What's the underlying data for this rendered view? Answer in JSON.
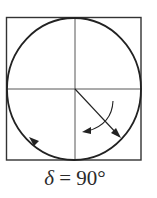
{
  "figure": {
    "caption": {
      "symbol": "δ",
      "equals": " = ",
      "value": "90°"
    },
    "elements": [
      {
        "name": "bounding-square",
        "type": "rect"
      },
      {
        "name": "trajectory-circle",
        "type": "ellipse"
      },
      {
        "name": "vertical-axis",
        "type": "line"
      },
      {
        "name": "horizontal-axis",
        "type": "line"
      },
      {
        "name": "field-vector",
        "type": "arrow",
        "direction": "down-right"
      },
      {
        "name": "rotation-arrow",
        "type": "curved-arrow",
        "direction": "clockwise"
      },
      {
        "name": "circle-direction-arrowhead",
        "type": "arrowhead",
        "direction": "up-left"
      }
    ],
    "colors": {
      "stroke": "#222222",
      "background": "#ffffff"
    }
  }
}
